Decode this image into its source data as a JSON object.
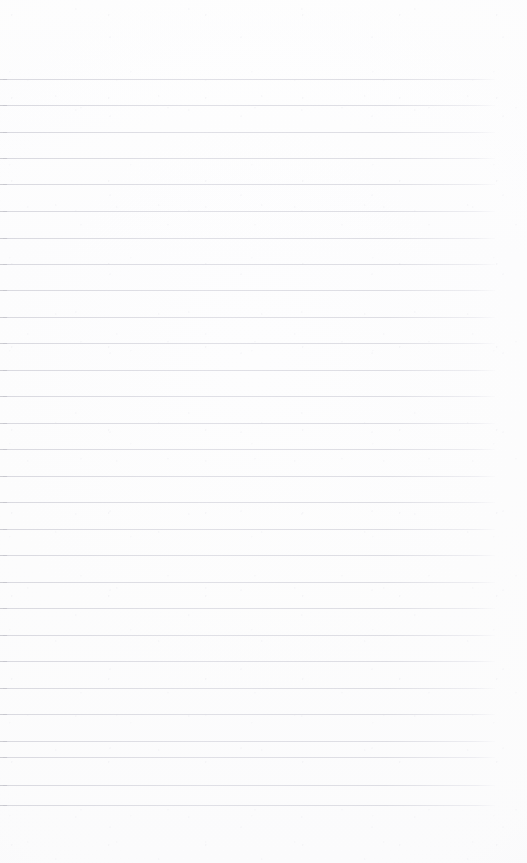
{
  "page": {
    "kind": "lined-notebook-page",
    "width": 527,
    "height": 863,
    "paper_color": "#fdfdfd",
    "rule_color": "#d8d8de",
    "rule_edge_color": "#c5c5cd",
    "content_text": "",
    "has_handwriting": false,
    "has_printed_text": false
  },
  "ruling": {
    "line_count": 28,
    "first_line_y": 79,
    "last_line_y": 805,
    "spacing": 26.9,
    "line_start_x": 3,
    "line_end_x": 495,
    "line_thickness": 1
  },
  "margins": {
    "top": 79,
    "bottom": 58,
    "left": 3,
    "right": 32
  },
  "rules": [
    {
      "y": 79,
      "x1": 3,
      "x2": 495
    },
    {
      "y": 105,
      "x1": 3,
      "x2": 495
    },
    {
      "y": 132,
      "x1": 3,
      "x2": 495
    },
    {
      "y": 158,
      "x1": 3,
      "x2": 495
    },
    {
      "y": 184,
      "x1": 3,
      "x2": 495
    },
    {
      "y": 211,
      "x1": 3,
      "x2": 495
    },
    {
      "y": 238,
      "x1": 3,
      "x2": 495
    },
    {
      "y": 264,
      "x1": 3,
      "x2": 495
    },
    {
      "y": 290,
      "x1": 3,
      "x2": 495
    },
    {
      "y": 317,
      "x1": 3,
      "x2": 495
    },
    {
      "y": 343,
      "x1": 3,
      "x2": 495
    },
    {
      "y": 370,
      "x1": 3,
      "x2": 495
    },
    {
      "y": 396,
      "x1": 3,
      "x2": 495
    },
    {
      "y": 423,
      "x1": 3,
      "x2": 495
    },
    {
      "y": 449,
      "x1": 3,
      "x2": 495
    },
    {
      "y": 476,
      "x1": 3,
      "x2": 495
    },
    {
      "y": 502,
      "x1": 3,
      "x2": 495
    },
    {
      "y": 529,
      "x1": 3,
      "x2": 495
    },
    {
      "y": 555,
      "x1": 3,
      "x2": 495
    },
    {
      "y": 582,
      "x1": 3,
      "x2": 495
    },
    {
      "y": 608,
      "x1": 3,
      "x2": 495
    },
    {
      "y": 635,
      "x1": 3,
      "x2": 495
    },
    {
      "y": 661,
      "x1": 3,
      "x2": 495
    },
    {
      "y": 688,
      "x1": 3,
      "x2": 495
    },
    {
      "y": 714,
      "x1": 3,
      "x2": 495
    },
    {
      "y": 741,
      "x1": 3,
      "x2": 495
    },
    {
      "y": 757,
      "x1": 3,
      "x2": 495
    },
    {
      "y": 785,
      "x1": 3,
      "x2": 495
    },
    {
      "y": 805,
      "x1": 3,
      "x2": 495
    }
  ]
}
